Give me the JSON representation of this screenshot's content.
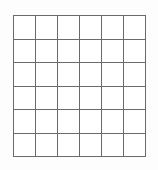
{
  "figure": {
    "title": "",
    "kind": "blank-grid",
    "background_color": "#fdfdfd",
    "cell_fill_color": "#ffffff",
    "line_color": "#6a6a6a",
    "line_width_px": 1,
    "columns": 6,
    "rows": 6,
    "total_cells": 36,
    "bounds": {
      "left_px": 13,
      "top_px": 15,
      "width_px": 133,
      "height_px": 142
    },
    "cell_size": {
      "width_px": 22.2,
      "height_px": 23.7
    },
    "cells": [
      [
        "",
        "",
        "",
        "",
        "",
        ""
      ],
      [
        "",
        "",
        "",
        "",
        "",
        ""
      ],
      [
        "",
        "",
        "",
        "",
        "",
        ""
      ],
      [
        "",
        "",
        "",
        "",
        "",
        ""
      ],
      [
        "",
        "",
        "",
        "",
        "",
        ""
      ],
      [
        "",
        "",
        "",
        "",
        "",
        ""
      ]
    ]
  }
}
